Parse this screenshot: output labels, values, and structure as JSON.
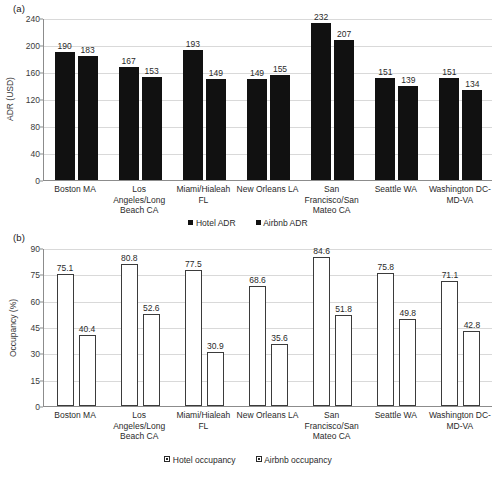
{
  "figure": {
    "panel_a_tag": "(a)",
    "panel_b_tag": "(b)"
  },
  "chart_data": [
    {
      "id": "panel-a",
      "type": "bar",
      "title": "",
      "panel_label": "(a)",
      "xlabel": "",
      "ylabel": "ADR (USD)",
      "ylim": [
        0,
        240
      ],
      "yticks": [
        0,
        40,
        80,
        120,
        160,
        200,
        240
      ],
      "ytick_labels": [
        "0",
        "40",
        "80",
        "120",
        "160",
        "200",
        "240"
      ],
      "grid": true,
      "legend_position": "bottom",
      "categories": [
        "Boston MA",
        "Los Angeles/Long Beach CA",
        "Miami/Hialeah FL",
        "New Orleans LA",
        "San Francisco/San Mateo CA",
        "Seattle WA",
        "Washington DC-MD-VA"
      ],
      "category_lines": [
        [
          "Boston MA"
        ],
        [
          "Los",
          "Angeles/Long",
          "Beach CA"
        ],
        [
          "Miami/Hialeah",
          "FL"
        ],
        [
          "New Orleans LA"
        ],
        [
          "San",
          "Francisco/San",
          "Mateo CA"
        ],
        [
          "Seattle WA"
        ],
        [
          "Washington DC-",
          "MD-VA"
        ]
      ],
      "series": [
        {
          "name": "Hotel ADR",
          "style": "filled",
          "color": "#111111",
          "values": [
            190,
            167,
            193,
            149,
            232,
            151,
            151
          ]
        },
        {
          "name": "Airbnb ADR",
          "style": "filled",
          "color": "#111111",
          "values": [
            183,
            153,
            149,
            155,
            207,
            139,
            134
          ]
        }
      ]
    },
    {
      "id": "panel-b",
      "type": "bar",
      "title": "",
      "panel_label": "(b)",
      "xlabel": "",
      "ylabel": "Occupancy (%)",
      "ylim": [
        0,
        90
      ],
      "yticks": [
        0,
        15,
        30,
        45,
        60,
        75,
        90
      ],
      "ytick_labels": [
        "0",
        "15",
        "30",
        "45",
        "60",
        "75",
        "90"
      ],
      "grid": true,
      "legend_position": "bottom",
      "categories": [
        "Boston MA",
        "Los Angeles/Long Beach CA",
        "Miami/Hialeah FL",
        "New Orleans LA",
        "San Francisco/San Mateo CA",
        "Seattle WA",
        "Washington DC-MD-VA"
      ],
      "category_lines": [
        [
          "Boston MA"
        ],
        [
          "Los",
          "Angeles/Long",
          "Beach CA"
        ],
        [
          "Miami/Hialeah",
          "FL"
        ],
        [
          "New Orleans LA"
        ],
        [
          "San",
          "Francisco/San",
          "Mateo CA"
        ],
        [
          "Seattle WA"
        ],
        [
          "Washington DC-",
          "MD-VA"
        ]
      ],
      "series": [
        {
          "name": "Hotel occupancy",
          "style": "outline",
          "color": "#ffffff",
          "values": [
            75.1,
            80.8,
            77.5,
            68.6,
            84.6,
            75.8,
            71.1
          ]
        },
        {
          "name": "Airbnb occupancy",
          "style": "outline",
          "color": "#ffffff",
          "values": [
            40.4,
            52.6,
            30.9,
            35.6,
            51.8,
            49.8,
            42.8
          ]
        }
      ]
    }
  ]
}
